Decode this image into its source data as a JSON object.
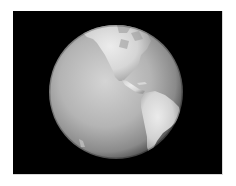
{
  "image": {
    "subject": "Earth globe showing the Americas",
    "background_color": "#000000",
    "page_color": "#ffffff",
    "globe": {
      "center": [
        103,
        81
      ],
      "radius": 67,
      "ocean_highlight": "#d2d2d2",
      "ocean_shadow": "#5a5a5a",
      "land_color": "#e8e8e8"
    },
    "regions": [
      {
        "name": "north-america"
      },
      {
        "name": "central-america"
      },
      {
        "name": "south-america"
      },
      {
        "name": "antarctica"
      },
      {
        "name": "pacific-islands"
      }
    ]
  }
}
